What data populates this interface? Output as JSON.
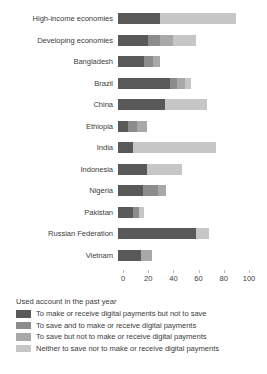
{
  "chart_data": {
    "type": "bar",
    "subtype": "horizontal-stacked",
    "title": "",
    "xlabel": "",
    "ylabel": "",
    "xlim": [
      0,
      100
    ],
    "xticks": [
      0,
      20,
      40,
      60,
      80,
      100
    ],
    "grid": false,
    "legend_position": "bottom-left",
    "legend_title": "Used account in the past year",
    "categories": [
      "High-income economies",
      "Developing economies",
      "Bangladesh",
      "Brazil",
      "China",
      "Ethiopia",
      "India",
      "Indonesia",
      "Nigeria",
      "Pakistan",
      "Russian Federation",
      "Vietnam"
    ],
    "series": [
      {
        "name": "To make or receive digital payments but not to save",
        "color": "#595959",
        "values": [
          33,
          24,
          21,
          41,
          37,
          8,
          12,
          23,
          20,
          12,
          62,
          18
        ]
      },
      {
        "name": "To save and to make or receive digital payments",
        "color": "#8c8c8c",
        "values": [
          0,
          9,
          7,
          6,
          0,
          7,
          0,
          0,
          12,
          5,
          0,
          0
        ]
      },
      {
        "name": "To save but not to make or receive digital payments",
        "color": "#a8a8a8",
        "values": [
          0,
          11,
          5,
          6,
          0,
          8,
          0,
          0,
          6,
          0,
          0,
          9
        ]
      },
      {
        "name": "Neither to save nor to make or receive digital payments",
        "color": "#c6c6c6",
        "values": [
          61,
          18,
          0,
          5,
          34,
          0,
          66,
          28,
          0,
          4,
          10,
          0
        ]
      }
    ]
  },
  "axis": {
    "tick_labels": [
      "0",
      "20",
      "40",
      "60",
      "80",
      "100"
    ]
  },
  "legend": {
    "title": "Used account in the past year",
    "items": [
      {
        "label": "To make or receive digital payments but not to save",
        "color": "#595959"
      },
      {
        "label": "To save and to make or receive digital payments",
        "color": "#8c8c8c"
      },
      {
        "label": "To save but not to make or receive digital payments",
        "color": "#a8a8a8"
      },
      {
        "label": "Neither to save nor to make or receive digital payments",
        "color": "#c6c6c6"
      }
    ]
  }
}
